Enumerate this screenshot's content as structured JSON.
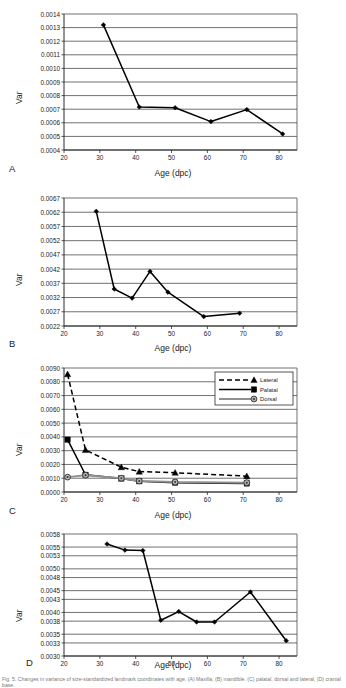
{
  "figure": {
    "axis_label_x": "Age (dpc)",
    "axis_label_y": "Var",
    "caption_line": "Fig. 5. Changes in variance of size-standardized landmark coordinates with age. (A) Maxilla, (B) mandible, (C) palatal, dorsal and lateral, (D) cranial base.",
    "panels": [
      {
        "letter": "A"
      },
      {
        "letter": "B"
      },
      {
        "letter": "C"
      },
      {
        "letter": "D"
      }
    ]
  },
  "chart_data": [
    {
      "type": "line",
      "panel": "A",
      "title": "",
      "xlabel": "Age (dpc)",
      "ylabel": "Var",
      "xlim": [
        20,
        85
      ],
      "ylim": [
        0.0004,
        0.0014
      ],
      "xticks": [
        20,
        30,
        40,
        50,
        60,
        70,
        80
      ],
      "yticks": [
        0.0004,
        0.0005,
        0.0006,
        0.0007,
        0.0008,
        0.0009,
        0.001,
        0.0011,
        0.0012,
        0.0013,
        0.0014
      ],
      "ytick_labels": [
        "0.0004",
        "0.0005",
        "0.0006",
        "0.0007",
        "0.0008",
        "0.0009",
        "0.0010",
        "0.0011",
        "0.0012",
        "0.0013",
        "0.0014"
      ],
      "grid": true,
      "legend": null,
      "series": [
        {
          "name": "Var",
          "marker": "diamond",
          "linestyle": "solid",
          "color": "#000000",
          "x": [
            31,
            41,
            51,
            61,
            71,
            81
          ],
          "y": [
            0.00132,
            0.000716,
            0.000711,
            0.000609,
            0.000697,
            0.000518
          ]
        }
      ]
    },
    {
      "type": "line",
      "panel": "B",
      "title": "",
      "xlabel": "Age (dpc)",
      "ylabel": "Var",
      "xlim": [
        20,
        85
      ],
      "ylim": [
        0.0022,
        0.0067
      ],
      "xticks": [
        20,
        30,
        40,
        50,
        60,
        70,
        80
      ],
      "yticks": [
        0.0022,
        0.0027,
        0.0032,
        0.0037,
        0.0042,
        0.0047,
        0.0052,
        0.0057,
        0.0062,
        0.0067
      ],
      "ytick_labels": [
        "0.0022",
        "0.0027",
        "0.0032",
        "0.0037",
        "0.0042",
        "0.0047",
        "0.0052",
        "0.0057",
        "0.0062",
        "0.0067"
      ],
      "grid": true,
      "legend": null,
      "series": [
        {
          "name": "Var",
          "marker": "diamond",
          "linestyle": "solid",
          "color": "#000000",
          "x": [
            29,
            34,
            39,
            44,
            49,
            59,
            69
          ],
          "y": [
            0.00623,
            0.0035,
            0.00318,
            0.00412,
            0.00339,
            0.00253,
            0.00265
          ]
        }
      ]
    },
    {
      "type": "line",
      "panel": "C",
      "title": "",
      "xlabel": "Age (dpc)",
      "ylabel": "Var",
      "xlim": [
        20,
        85
      ],
      "ylim": [
        0.0,
        0.009
      ],
      "xticks": [
        20,
        30,
        40,
        50,
        60,
        70,
        80
      ],
      "yticks": [
        0.0,
        0.001,
        0.002,
        0.003,
        0.004,
        0.005,
        0.006,
        0.007,
        0.008,
        0.009
      ],
      "ytick_labels": [
        "0.0000",
        "0.0010",
        "0.0020",
        "0.0030",
        "0.0040",
        "0.0050",
        "0.0060",
        "0.0070",
        "0.0080",
        "0.0090"
      ],
      "grid": true,
      "legend": {
        "position": "top-right",
        "entries": [
          "Lateral",
          "Palatal",
          "Dorsal"
        ]
      },
      "series": [
        {
          "name": "Lateral",
          "marker": "triangle",
          "linestyle": "dashed",
          "color": "#000000",
          "x": [
            21,
            26,
            36,
            41,
            51,
            71
          ],
          "y": [
            0.00855,
            0.00305,
            0.0018,
            0.00148,
            0.0014,
            0.00115
          ]
        },
        {
          "name": "Palatal",
          "marker": "square",
          "linestyle": "solid",
          "color": "#000000",
          "x": [
            21,
            26,
            36,
            41,
            51,
            71
          ],
          "y": [
            0.0038,
            0.00125,
            0.00098,
            0.00078,
            0.00068,
            0.00062
          ]
        },
        {
          "name": "Dorsal",
          "marker": "circle",
          "linestyle": "solid",
          "color": "#909090",
          "x": [
            21,
            26,
            36,
            41,
            51,
            71
          ],
          "y": [
            0.00108,
            0.00122,
            0.001,
            0.0008,
            0.00072,
            0.00068
          ]
        }
      ]
    },
    {
      "type": "line",
      "panel": "D",
      "title": "",
      "xlabel": "Age (dpc)",
      "ylabel": "Var",
      "xlim": [
        20,
        85
      ],
      "ylim": [
        0.003,
        0.0058
      ],
      "xticks": [
        20,
        30,
        40,
        50,
        60,
        70,
        80
      ],
      "yticks": [
        0.003,
        0.0033,
        0.0035,
        0.0038,
        0.004,
        0.0043,
        0.0045,
        0.0048,
        0.005,
        0.0053,
        0.0055,
        0.0058
      ],
      "ytick_labels": [
        "0.0030",
        "0.0033",
        "0.0035",
        "0.0038",
        "0.0040",
        "0.0043",
        "0.0045",
        "0.0048",
        "0.0050",
        "0.0053",
        "0.0055",
        "0.0058"
      ],
      "grid": true,
      "legend": null,
      "series": [
        {
          "name": "Var",
          "marker": "diamond",
          "linestyle": "solid",
          "color": "#000000",
          "x": [
            32,
            37,
            42,
            47,
            52,
            57,
            62,
            72,
            82
          ],
          "y": [
            0.00557,
            0.00543,
            0.00542,
            0.00382,
            0.00402,
            0.00378,
            0.00378,
            0.00447,
            0.00335
          ]
        }
      ]
    }
  ]
}
